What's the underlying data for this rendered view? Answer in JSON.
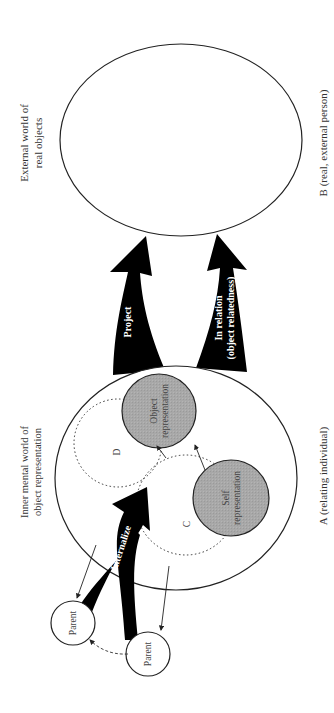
{
  "labels": {
    "external_world": [
      "External world of",
      "real objects"
    ],
    "inner_world": [
      "Inner mental world of",
      "object representation"
    ],
    "person_b": "B  (real, external person)",
    "person_a": "A  (relating individual)"
  },
  "arrows": {
    "project": "Project",
    "in_relation": [
      "In relation",
      "(object relatedness)"
    ],
    "internalize": "Internalize"
  },
  "circles": {
    "object_representation": [
      "Object",
      "representation"
    ],
    "self_representation": [
      "Self",
      "representation"
    ],
    "d": "D",
    "c": "C",
    "parent_1": "Parent",
    "parent_2": "Parent"
  },
  "colors": {
    "representation_fill": "#a9a9a9",
    "arrow_fill": "#000000"
  }
}
